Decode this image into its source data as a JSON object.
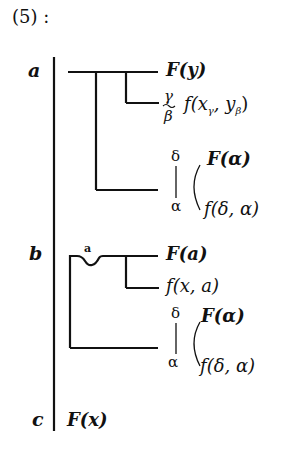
{
  "heading": "(5) :",
  "labels": {
    "a": "a",
    "b": "b",
    "c": "c"
  },
  "block_a": {
    "top": "F(y)",
    "sub_f": "f(x",
    "sub_gamma": "γ",
    "sub_sep": ", y",
    "sub_beta": "β",
    "sub_close": ")",
    "tilde_top": "γ",
    "tilde_bottom": "β",
    "branch_delta": "δ",
    "branch_alpha": "α",
    "branch_top": "F(α)",
    "branch_bottom": "f(δ, α)"
  },
  "block_b": {
    "dip_label": "a",
    "top": "F(a)",
    "second": "f(x, a)",
    "branch_delta": "δ",
    "branch_alpha": "α",
    "branch_top": "F(α)",
    "branch_bottom": "f(δ, α)"
  },
  "block_c": {
    "formula": "F(x)"
  },
  "colors": {
    "ink": "#111111",
    "background": "#ffffff"
  }
}
